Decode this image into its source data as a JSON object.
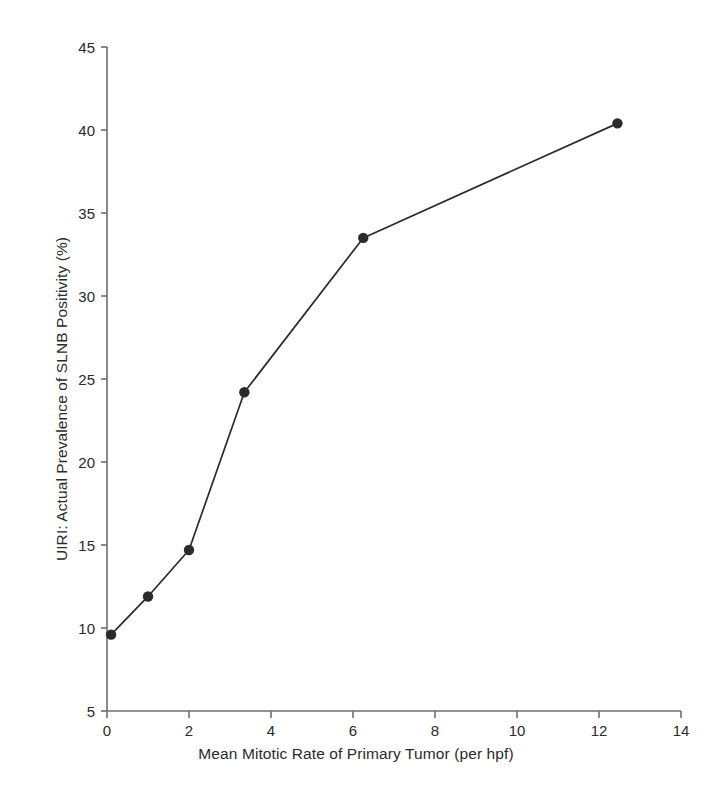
{
  "chart_data": {
    "type": "line",
    "title": "",
    "subtitle": "",
    "xlabel": "Mean Mitotic Rate of Primary Tumor (per hpf)",
    "ylabel": "UIRI: Actual Prevalence of SLNB Positivity (%)",
    "xlim": [
      0,
      14
    ],
    "ylim": [
      5,
      45
    ],
    "xticks": [
      0,
      2,
      4,
      6,
      8,
      10,
      12,
      14
    ],
    "xtick_labels": [
      "0",
      "2",
      "4",
      "6",
      "8",
      "10",
      "12",
      "14"
    ],
    "yticks": [
      5,
      10,
      15,
      20,
      25,
      30,
      35,
      40,
      45
    ],
    "ytick_labels": [
      "5",
      "10",
      "15",
      "20",
      "25",
      "30",
      "35",
      "40",
      "45"
    ],
    "grid": false,
    "legend": "none",
    "marker": "filled-circle",
    "line_color": "#2b2b2b",
    "marker_color": "#2b2b2b",
    "axis_color": "#6e6e6e",
    "x": [
      0.1,
      1.0,
      2.0,
      3.35,
      6.25,
      12.45
    ],
    "y": [
      9.6,
      11.9,
      14.7,
      24.2,
      33.5,
      40.4
    ],
    "series": [
      {
        "name": "UIRI: Actual Prevalence of SLNB Positivity (%)",
        "points": [
          {
            "x": 0.1,
            "y": 9.6
          },
          {
            "x": 1.0,
            "y": 11.9
          },
          {
            "x": 2.0,
            "y": 14.7
          },
          {
            "x": 3.35,
            "y": 24.2
          },
          {
            "x": 6.25,
            "y": 33.5
          },
          {
            "x": 12.45,
            "y": 40.4
          }
        ]
      }
    ],
    "annotations": []
  }
}
